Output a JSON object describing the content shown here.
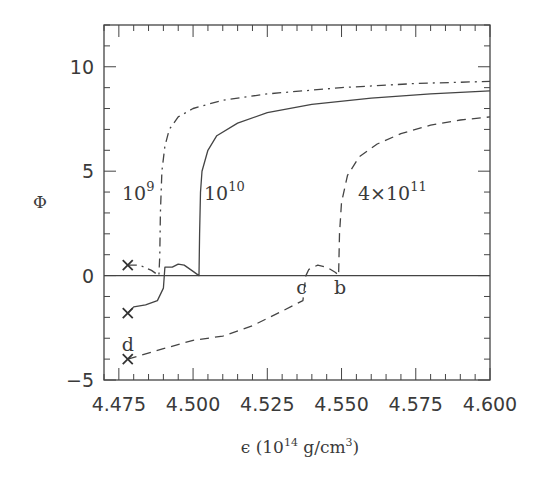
{
  "chart_data": {
    "type": "line",
    "title": "",
    "xlabel": "ϵ (10^14 g/cm^3)",
    "xlabel_parts": {
      "base": "ϵ (10",
      "exp": "14",
      "unit": " g/cm",
      "unit_exp": "3",
      "close": ")"
    },
    "ylabel": "Φ",
    "xlim": [
      4.47,
      4.6
    ],
    "ylim": [
      -5,
      12
    ],
    "x_ticks": [
      4.475,
      4.5,
      4.525,
      4.55,
      4.575,
      4.6
    ],
    "x_tick_labels": [
      "4.475",
      "4.500",
      "4.525",
      "4.550",
      "4.575",
      "4.600"
    ],
    "y_ticks": [
      -5,
      0,
      5,
      10
    ],
    "y_tick_labels": [
      "−5",
      "0",
      "5",
      "10"
    ],
    "grid": false,
    "legend": "inline labels",
    "series": [
      {
        "name": "10^9",
        "label_base": "10",
        "label_exp": "9",
        "style": "dash-dot",
        "points": [
          [
            4.478,
            0.5
          ],
          [
            4.482,
            0.5
          ],
          [
            4.486,
            0.25
          ],
          [
            4.4885,
            0.0
          ],
          [
            4.4888,
            1.0
          ],
          [
            4.489,
            3.0
          ],
          [
            4.4895,
            5.0
          ],
          [
            4.4905,
            6.2
          ],
          [
            4.492,
            7.0
          ],
          [
            4.495,
            7.6
          ],
          [
            4.5,
            8.0
          ],
          [
            4.51,
            8.4
          ],
          [
            4.525,
            8.7
          ],
          [
            4.55,
            9.0
          ],
          [
            4.575,
            9.2
          ],
          [
            4.6,
            9.3
          ]
        ]
      },
      {
        "name": "10^10",
        "label_base": "10",
        "label_exp": "10",
        "style": "solid",
        "points": [
          [
            4.478,
            -1.8
          ],
          [
            4.48,
            -1.5
          ],
          [
            4.484,
            -1.4
          ],
          [
            4.488,
            -1.2
          ],
          [
            4.49,
            -0.6
          ],
          [
            4.4905,
            0.4
          ],
          [
            4.493,
            0.4
          ],
          [
            4.495,
            0.55
          ],
          [
            4.497,
            0.5
          ],
          [
            4.5,
            0.2
          ],
          [
            4.502,
            0.0
          ],
          [
            4.5022,
            2.0
          ],
          [
            4.5025,
            4.0
          ],
          [
            4.503,
            5.0
          ],
          [
            4.505,
            6.0
          ],
          [
            4.508,
            6.7
          ],
          [
            4.515,
            7.3
          ],
          [
            4.525,
            7.8
          ],
          [
            4.54,
            8.2
          ],
          [
            4.56,
            8.5
          ],
          [
            4.58,
            8.7
          ],
          [
            4.6,
            8.85
          ]
        ]
      },
      {
        "name": "4×10^11",
        "label_base": "4×10",
        "label_exp": "11",
        "style": "dashed",
        "points": [
          [
            4.478,
            -4.0
          ],
          [
            4.49,
            -3.5
          ],
          [
            4.5,
            -3.1
          ],
          [
            4.51,
            -2.9
          ],
          [
            4.52,
            -2.4
          ],
          [
            4.53,
            -1.7
          ],
          [
            4.537,
            -1.2
          ],
          [
            4.538,
            0.0
          ],
          [
            4.539,
            0.3
          ],
          [
            4.542,
            0.5
          ],
          [
            4.545,
            0.4
          ],
          [
            4.548,
            0.15
          ],
          [
            4.549,
            0.0
          ],
          [
            4.5493,
            2.0
          ],
          [
            4.55,
            3.5
          ],
          [
            4.552,
            4.8
          ],
          [
            4.556,
            5.7
          ],
          [
            4.562,
            6.3
          ],
          [
            4.57,
            6.8
          ],
          [
            4.58,
            7.2
          ],
          [
            4.59,
            7.45
          ],
          [
            4.6,
            7.6
          ]
        ]
      }
    ],
    "markers": [
      {
        "symbol": "×",
        "x": 4.478,
        "y": 0.5
      },
      {
        "symbol": "×",
        "x": 4.478,
        "y": -1.8
      },
      {
        "symbol": "×",
        "x": 4.478,
        "y": -4.0
      }
    ],
    "annotations": [
      {
        "text": "d",
        "x": 4.478,
        "y": -3.3
      },
      {
        "text": "c",
        "x": 4.5365,
        "y": -0.6
      },
      {
        "text": "b",
        "x": 4.5495,
        "y": -0.6
      }
    ],
    "reference_lines": [
      {
        "orientation": "horizontal",
        "y": 0
      }
    ]
  }
}
